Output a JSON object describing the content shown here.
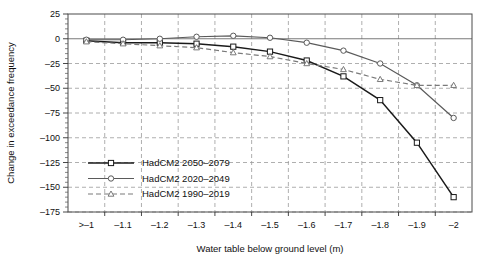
{
  "chart_data": {
    "type": "line",
    "title": "",
    "xlabel": "Water table below ground level (m)",
    "ylabel": "Change in exceedance frequency",
    "categories": [
      ">–1",
      "–1.1",
      "–1.2",
      "–1.3",
      "–1.4",
      "–1.5",
      "–1.6",
      "–1.7",
      "–1.8",
      "–1.9",
      "–2"
    ],
    "ylim": [
      -175,
      25
    ],
    "yticks": [
      25,
      0,
      -25,
      -50,
      -75,
      -100,
      -125,
      -150,
      -175
    ],
    "ytick_labels": [
      "25",
      "0",
      "–25",
      "–50",
      "–75",
      "–100",
      "–125",
      "–150",
      "–175"
    ],
    "grid": true,
    "legend_position": "lower-left-inside",
    "series": [
      {
        "name": "HadCM2 2050–2079",
        "values": [
          -2,
          -4,
          -4,
          -5,
          -8,
          -13,
          -22,
          -38,
          -62,
          -105,
          -160
        ],
        "color": "#1a1a1a",
        "marker": "square",
        "dash": "none"
      },
      {
        "name": "HadCM2 2020–2049",
        "values": [
          -1,
          -1,
          0,
          2,
          3,
          1,
          -4,
          -12,
          -25,
          -47,
          -80
        ],
        "color": "#5a5a5a",
        "marker": "circle",
        "dash": "none"
      },
      {
        "name": "HadCM2 1990–2019",
        "values": [
          -3,
          -5,
          -7,
          -9,
          -14,
          -18,
          -25,
          -31,
          -41,
          -47,
          -47
        ],
        "color": "#7a7a7a",
        "marker": "triangle",
        "dash": "dashed"
      }
    ]
  },
  "legend": {
    "items": [
      {
        "label": "HadCM2 2050–2079"
      },
      {
        "label": "HadCM2 2020–2049"
      },
      {
        "label": "HadCM2 1990–2019"
      }
    ]
  },
  "colors": {
    "series_1": "#1a1a1a",
    "series_2": "#5a5a5a",
    "series_3": "#7a7a7a",
    "grid": "#9a9a9a",
    "frame": "#4a4a4a",
    "background": "#ffffff"
  }
}
